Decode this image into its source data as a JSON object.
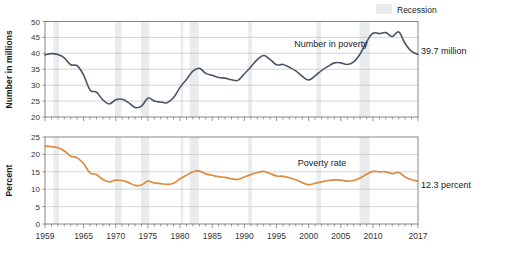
{
  "legend": {
    "recession_label": "Recession",
    "recession_color": "#e9ecef"
  },
  "chart_data": [
    {
      "type": "line",
      "id": "number-in-poverty",
      "title": "",
      "xlabel": "",
      "ylabel": "Number in millions",
      "series_label": "Number in poverty",
      "end_label": "39.7 million",
      "line_color": "#4a5568",
      "xlim": [
        1959,
        2017
      ],
      "ylim": [
        20,
        50
      ],
      "yticks": [
        20,
        25,
        30,
        35,
        40,
        45,
        50
      ],
      "ytick_labels": [
        "20",
        "25",
        "30",
        "35",
        "40",
        "45",
        "50"
      ],
      "xticks": [
        1959,
        1965,
        1970,
        1975,
        1980,
        1985,
        1990,
        1995,
        2000,
        2005,
        2010,
        2017
      ],
      "xtick_labels": [
        "1959",
        "1965",
        "1970",
        "1975",
        "1980",
        "1985",
        "1990",
        "1995",
        "2000",
        "2005",
        "2010",
        "2017"
      ],
      "grid": true,
      "x": [
        1959,
        1960,
        1961,
        1962,
        1963,
        1964,
        1965,
        1966,
        1967,
        1968,
        1969,
        1970,
        1971,
        1972,
        1973,
        1974,
        1975,
        1976,
        1977,
        1978,
        1979,
        1980,
        1981,
        1982,
        1983,
        1984,
        1985,
        1986,
        1987,
        1988,
        1989,
        1990,
        1991,
        1992,
        1993,
        1994,
        1995,
        1996,
        1997,
        1998,
        1999,
        2000,
        2001,
        2002,
        2003,
        2004,
        2005,
        2006,
        2007,
        2008,
        2009,
        2010,
        2011,
        2012,
        2013,
        2014,
        2015,
        2016,
        2017
      ],
      "values": [
        39.5,
        39.9,
        39.6,
        38.6,
        36.4,
        36.1,
        33.2,
        28.5,
        27.8,
        25.4,
        24.1,
        25.4,
        25.6,
        24.5,
        23.0,
        23.4,
        25.9,
        25.0,
        24.7,
        24.5,
        26.1,
        29.3,
        31.8,
        34.4,
        35.3,
        33.7,
        33.1,
        32.4,
        32.2,
        31.7,
        31.5,
        33.6,
        35.7,
        38.0,
        39.3,
        38.1,
        36.4,
        36.5,
        35.6,
        34.5,
        32.8,
        31.6,
        32.9,
        34.6,
        35.9,
        37.0,
        37.0,
        36.5,
        37.3,
        39.8,
        43.6,
        46.3,
        46.2,
        46.5,
        45.3,
        46.7,
        43.1,
        40.6,
        39.7
      ]
    },
    {
      "type": "line",
      "id": "poverty-rate",
      "title": "",
      "xlabel": "",
      "ylabel": "Percent",
      "series_label": "Poverty rate",
      "end_label": "12.3 percent",
      "line_color": "#e08a3c",
      "xlim": [
        1959,
        2017
      ],
      "ylim": [
        0,
        25
      ],
      "yticks": [
        0,
        5,
        10,
        15,
        20,
        25
      ],
      "ytick_labels": [
        "0",
        "5",
        "10",
        "15",
        "20",
        "25"
      ],
      "xticks": [
        1959,
        1965,
        1970,
        1975,
        1980,
        1985,
        1990,
        1995,
        2000,
        2005,
        2010,
        2017
      ],
      "xtick_labels": [
        "1959",
        "1965",
        "1970",
        "1975",
        "1980",
        "1985",
        "1990",
        "1995",
        "2000",
        "2005",
        "2010",
        "2017"
      ],
      "grid": true,
      "x": [
        1959,
        1960,
        1961,
        1962,
        1963,
        1964,
        1965,
        1966,
        1967,
        1968,
        1969,
        1970,
        1971,
        1972,
        1973,
        1974,
        1975,
        1976,
        1977,
        1978,
        1979,
        1980,
        1981,
        1982,
        1983,
        1984,
        1985,
        1986,
        1987,
        1988,
        1989,
        1990,
        1991,
        1992,
        1993,
        1994,
        1995,
        1996,
        1997,
        1998,
        1999,
        2000,
        2001,
        2002,
        2003,
        2004,
        2005,
        2006,
        2007,
        2008,
        2009,
        2010,
        2011,
        2012,
        2013,
        2014,
        2015,
        2016,
        2017
      ],
      "values": [
        22.4,
        22.2,
        21.9,
        21.0,
        19.5,
        19.0,
        17.3,
        14.7,
        14.2,
        12.8,
        12.1,
        12.6,
        12.5,
        11.9,
        11.1,
        11.2,
        12.3,
        11.8,
        11.6,
        11.4,
        11.7,
        13.0,
        14.0,
        15.0,
        15.2,
        14.4,
        14.0,
        13.6,
        13.4,
        13.0,
        12.8,
        13.5,
        14.2,
        14.8,
        15.1,
        14.5,
        13.8,
        13.7,
        13.3,
        12.7,
        11.9,
        11.3,
        11.7,
        12.1,
        12.5,
        12.7,
        12.6,
        12.3,
        12.5,
        13.2,
        14.3,
        15.1,
        15.0,
        15.0,
        14.5,
        14.8,
        13.5,
        12.7,
        12.3
      ]
    }
  ],
  "recessions": [
    {
      "start": 1960.3,
      "end": 1961.2
    },
    {
      "start": 1969.9,
      "end": 1970.9
    },
    {
      "start": 1973.9,
      "end": 1975.2
    },
    {
      "start": 1980.1,
      "end": 1980.5
    },
    {
      "start": 1981.5,
      "end": 1982.9
    },
    {
      "start": 1990.6,
      "end": 1991.2
    },
    {
      "start": 2001.2,
      "end": 2001.9
    },
    {
      "start": 2007.9,
      "end": 2009.5
    }
  ]
}
